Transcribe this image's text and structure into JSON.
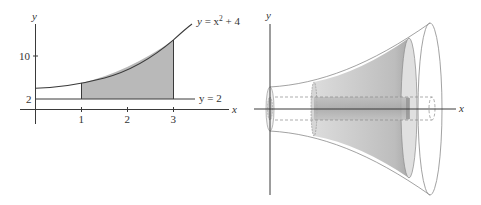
{
  "left_figure": {
    "axes": {
      "x_label": "x",
      "y_label": "y"
    },
    "x_ticks": [
      "1",
      "2",
      "3"
    ],
    "y_ticks": [
      "2",
      "10"
    ],
    "curves": [
      {
        "label_var": "y",
        "label_eq": " = x",
        "label_exp": "2",
        "label_rest": " + 4"
      },
      {
        "label": "y = 2"
      }
    ],
    "shaded_region": {
      "from_x": 1,
      "to_x": 3,
      "between": [
        "y = 2",
        "y = x^2 + 4"
      ]
    }
  },
  "right_figure": {
    "axes": {
      "x_label": "x",
      "y_label": "y"
    },
    "description": "Solid of revolution with cylindrical hole"
  },
  "colors": {
    "line": "#3a3a3a",
    "shade": "#b8b8b8",
    "solid_shade": "#cfcfcf",
    "thin_line": "#8a8a8a"
  }
}
